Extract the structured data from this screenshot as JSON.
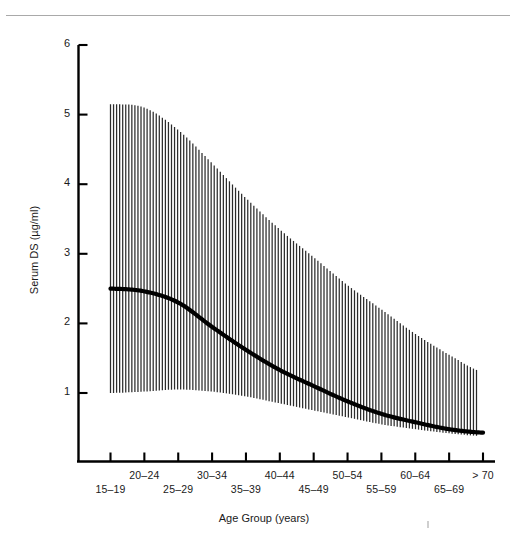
{
  "figure": {
    "name": "serum-ds-by-age-group-figure",
    "top_rule": true
  },
  "axis_titles": {
    "y": "Serum DS (µg/ml)",
    "x": "Age Group (years)"
  },
  "y_ticks": [
    {
      "value": 1,
      "label": "1"
    },
    {
      "value": 2,
      "label": "2"
    },
    {
      "value": 3,
      "label": "3"
    },
    {
      "value": 4,
      "label": "4"
    },
    {
      "value": 5,
      "label": "5"
    },
    {
      "value": 6,
      "label": "6"
    }
  ],
  "x_categories": [
    "15–19",
    "20–24",
    "25–29",
    "30–34",
    "35–39",
    "40–44",
    "45–49",
    "50–54",
    "55–59",
    "60–64",
    "65–69",
    "> 70"
  ],
  "chart_data": {
    "type": "line",
    "title": "",
    "subtitle": "",
    "xlabel": "Age Group (years)",
    "ylabel": "Serum DS (µg/ml)",
    "ylim": [
      0,
      6
    ],
    "y_ticks": [
      1,
      2,
      3,
      4,
      5,
      6
    ],
    "grid": false,
    "legend": "none",
    "categories": [
      "15–19",
      "20–24",
      "25–29",
      "30–34",
      "35–39",
      "40–44",
      "45–49",
      "50–54",
      "55–59",
      "60–64",
      "65–69",
      "> 70"
    ],
    "series": [
      {
        "name": "Mean serum DS",
        "style": "thick-black-line",
        "values": [
          2.5,
          2.46,
          2.3,
          1.95,
          1.62,
          1.33,
          1.1,
          0.88,
          0.7,
          0.58,
          0.48,
          0.43
        ]
      },
      {
        "name": "Upper range (hatched band top)",
        "style": "vertical-line-hatching",
        "values": [
          5.15,
          5.1,
          4.78,
          4.3,
          3.8,
          3.35,
          2.95,
          2.55,
          2.2,
          1.85,
          1.55,
          1.3
        ]
      },
      {
        "name": "Lower range (hatched band bottom)",
        "style": "vertical-line-hatching",
        "values": [
          1.0,
          1.02,
          1.05,
          1.02,
          0.95,
          0.85,
          0.75,
          0.65,
          0.55,
          0.48,
          0.42,
          0.38
        ]
      }
    ],
    "annotation": "Shaded band of vertical hatch lines spans the range about the mean curve; mean declines monotonically with age."
  }
}
